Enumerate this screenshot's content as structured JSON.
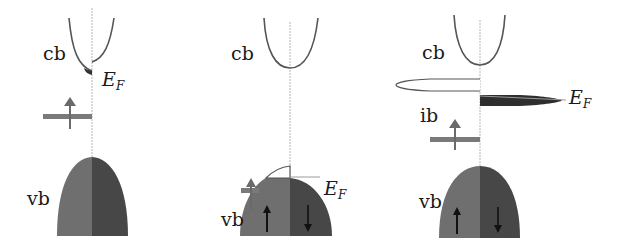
{
  "figure": {
    "colors": {
      "band_outline": "#4a4a4a",
      "spin_up_fill": "#6f6f6f",
      "spin_down_fill": "#474747",
      "impurity_level": "#7a7a7a",
      "axis_line": "#b5b5b5",
      "ef_line": "#9a9a9a"
    },
    "panels": [
      {
        "id": "panel-1",
        "labels": {
          "cb": "cb",
          "vb": "vb",
          "ef_main": "E",
          "ef_sub": "F"
        },
        "features": [
          "conduction band with small occupied spin-down pocket at Fermi level",
          "localized spin-up impurity level",
          "valence band"
        ]
      },
      {
        "id": "panel-2",
        "labels": {
          "cb": "cb",
          "vb": "vb",
          "ef_main": "E",
          "ef_sub": "F"
        },
        "arrows": {
          "up": "↑",
          "down": "↓"
        },
        "features": [
          "conduction band",
          "spin-up level merged with valence band top",
          "Fermi level within valence band (holes)"
        ]
      },
      {
        "id": "panel-3",
        "labels": {
          "cb": "cb",
          "ib": "ib",
          "vb": "vb",
          "ef_main": "E",
          "ef_sub": "F"
        },
        "arrows": {
          "up": "↑",
          "down": "↓"
        },
        "features": [
          "conduction band",
          "empty spin-up impurity band",
          "partially filled spin-down impurity band at Fermi level",
          "localized spin-up level",
          "valence band"
        ]
      }
    ]
  }
}
